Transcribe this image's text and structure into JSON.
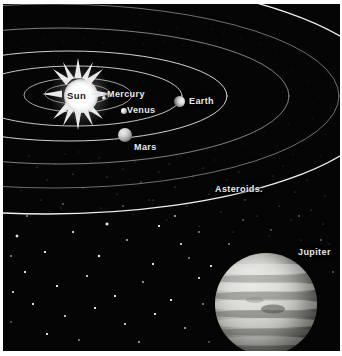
{
  "figure": {
    "kind": "astronomy-illustration",
    "background_color": "#050505",
    "border_color": "#ffffff",
    "label_color": "#eaeaea",
    "sun_label_color": "#1a1a1a"
  },
  "labels": {
    "sun": "Sun",
    "mercury": "Mercury",
    "venus": "Venus",
    "earth": "Earth",
    "mars": "Mars",
    "asteroids": "Asteroids.",
    "jupiter": "Jupiter"
  },
  "bodies": [
    {
      "name": "Sun",
      "label": "Sun",
      "type": "star",
      "x": 78,
      "y": 92,
      "radius": 17,
      "appearance": "starburst-corona"
    },
    {
      "name": "Mercury",
      "label": "Mercury",
      "type": "planet",
      "x": 101,
      "y": 93,
      "radius": 2,
      "appearance": "tiny-grey-dot"
    },
    {
      "name": "Venus",
      "label": "Venus",
      "type": "planet",
      "x": 121,
      "y": 107,
      "radius": 2.75,
      "appearance": "small-grey-sphere"
    },
    {
      "name": "Earth",
      "label": "Earth",
      "type": "planet",
      "x": 176,
      "y": 97,
      "radius": 5.5,
      "appearance": "grey-sphere-crescent"
    },
    {
      "name": "Mars",
      "label": "Mars",
      "type": "planet",
      "x": 122,
      "y": 131,
      "radius": 7,
      "appearance": "grey-sphere"
    },
    {
      "name": "Jupiter",
      "label": "Jupiter",
      "type": "planet",
      "x": 263,
      "y": 300,
      "radius": 51,
      "appearance": "banded-giant"
    }
  ],
  "regions": [
    {
      "name": "asteroid-belt",
      "label": "Asteroids.",
      "description": "broad speckled band of small bodies between Mars and Jupiter"
    },
    {
      "name": "starfield",
      "label": "",
      "description": "scattered white stars on black sky"
    }
  ],
  "orbits": [
    {
      "body": "Mercury",
      "index": 1
    },
    {
      "body": "Venus",
      "index": 2
    },
    {
      "body": "Earth",
      "index": 3
    },
    {
      "body": "Mars",
      "index": 4
    },
    {
      "body": "Asteroid belt inner",
      "index": 5
    },
    {
      "body": "Asteroid belt outer",
      "index": 6
    },
    {
      "body": "Jupiter",
      "index": 7
    }
  ],
  "label_positions": {
    "sun": {
      "x": 64,
      "y": 86
    },
    "mercury": {
      "x": 104,
      "y": 85
    },
    "venus": {
      "x": 124,
      "y": 101
    },
    "earth": {
      "x": 186,
      "y": 92
    },
    "mars": {
      "x": 131,
      "y": 138
    },
    "asteroids": {
      "x": 212,
      "y": 180
    },
    "jupiter": {
      "x": 295,
      "y": 243
    }
  }
}
